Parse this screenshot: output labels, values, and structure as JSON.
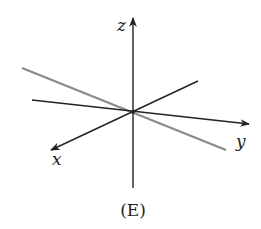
{
  "diagram": {
    "type": "3d-axes-with-line",
    "caption": "(E)",
    "axes": {
      "x": {
        "label": "x"
      },
      "y": {
        "label": "y"
      },
      "z": {
        "label": "z"
      }
    },
    "line": {
      "description": "gray line passing through origin",
      "color": "#8a8a8a"
    },
    "colors": {
      "axis": "#222222",
      "line": "#8a8a8a",
      "background": "#ffffff"
    }
  }
}
